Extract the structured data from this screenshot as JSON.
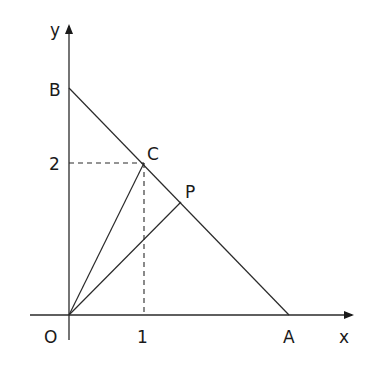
{
  "diagram": {
    "axes": {
      "x_label": "x",
      "y_label": "y",
      "origin_label": "O"
    },
    "ticks": {
      "x_tick": "1",
      "y_tick": "2"
    },
    "points": {
      "A": "A",
      "B": "B",
      "C": "C",
      "P": "P"
    },
    "segments": [
      "BA",
      "OC",
      "OP"
    ],
    "dashed_guides": [
      "C to y-axis at 2",
      "C to x-axis at 1"
    ],
    "colors": {
      "line": "#2a2a2a",
      "background": "#ffffff"
    }
  }
}
